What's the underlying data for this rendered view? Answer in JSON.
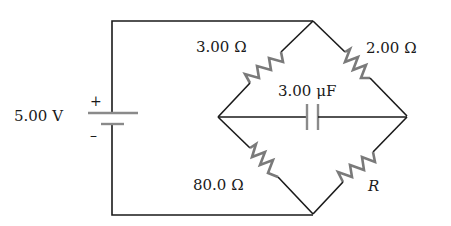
{
  "circuit": {
    "battery": {
      "label": "5.00 V",
      "plus": "+",
      "minus": "–"
    },
    "resistors": {
      "top_left": "3.00 Ω",
      "top_right": "2.00 Ω",
      "bottom_left": "80.0 Ω",
      "bottom_right": "R"
    },
    "capacitor": {
      "label": "3.00 μF"
    }
  },
  "colors": {
    "wire": "#1a1a1a",
    "component": "#7a7a7a",
    "background": "#ffffff"
  }
}
